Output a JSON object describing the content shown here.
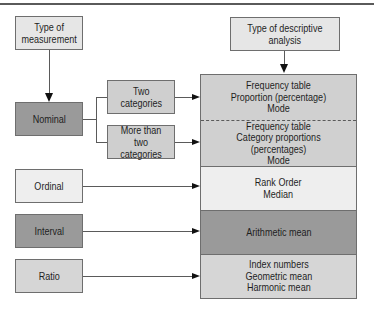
{
  "diagram": {
    "left_header": {
      "label": "Type of\nmeasurement"
    },
    "right_header": {
      "label": "Type of descriptive\nanalysis"
    },
    "measurements": [
      {
        "id": "nominal",
        "label": "Nominal",
        "color": "#9a9a9a"
      },
      {
        "id": "ordinal",
        "label": "Ordinal",
        "color": "#eeeeee"
      },
      {
        "id": "interval",
        "label": "Interval",
        "color": "#9a9a9a"
      },
      {
        "id": "ratio",
        "label": "Ratio",
        "color": "#d6d6d6"
      }
    ],
    "nominal_branches": [
      {
        "label": "Two\ncategories"
      },
      {
        "label": "More than\ntwo categories"
      }
    ],
    "analyses": [
      {
        "for": "Nominal - Two categories",
        "label": "Frequency table\nProportion (percentage)\nMode",
        "color": "#d0d0d0"
      },
      {
        "for": "Nominal - More than two categories",
        "label": "Frequency table\nCategory proportions (percentages)\nMode",
        "color": "#d0d0d0"
      },
      {
        "for": "Ordinal",
        "label": "Rank Order\nMedian",
        "color": "#eeeeee"
      },
      {
        "for": "Interval",
        "label": "Arithmetic mean",
        "color": "#9a9a9a"
      },
      {
        "for": "Ratio",
        "label": "Index numbers\nGeometric mean\nHarmonic mean",
        "color": "#d6d6d6"
      }
    ]
  }
}
